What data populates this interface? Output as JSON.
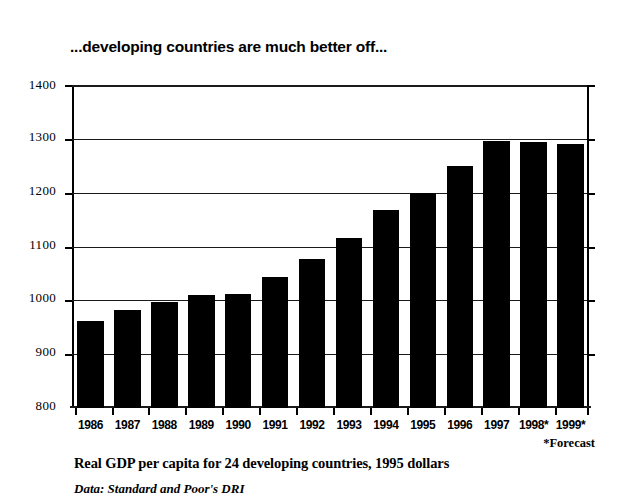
{
  "chart_data": {
    "type": "bar",
    "title": "...developing countries are much better off...",
    "subtitle": "Real GDP per capita for 24 developing countries, 1995 dollars",
    "source": "Data: Standard and Poor's DRI",
    "footnote": "*Forecast",
    "xlabel": "",
    "ylabel": "",
    "ylim": [
      800,
      1400
    ],
    "ytick_step": 100,
    "grid": true,
    "legend": "none",
    "bar_color": "#000000",
    "background_color": "#ffffff",
    "categories": [
      "1986",
      "1987",
      "1988",
      "1989",
      "1990",
      "1991",
      "1992",
      "1993",
      "1994",
      "1995",
      "1996",
      "1997",
      "1998*",
      "1999*"
    ],
    "values": [
      962,
      984,
      998,
      1011,
      1014,
      1044,
      1079,
      1118,
      1170,
      1202,
      1252,
      1300,
      1297,
      1293
    ],
    "ytick_labels": [
      "1400",
      "1300",
      "1200",
      "1100",
      "1000",
      "900",
      "800"
    ],
    "ytick_values": [
      1400,
      1300,
      1200,
      1100,
      1000,
      900,
      800
    ]
  }
}
